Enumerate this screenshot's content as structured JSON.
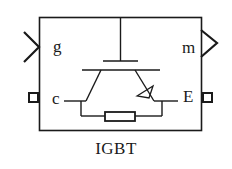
{
  "block": {
    "title": "IGBT",
    "ports": {
      "gate": {
        "label": "g",
        "type": "input-signal",
        "side": "left"
      },
      "measurement": {
        "label": "m",
        "type": "output-signal",
        "side": "right"
      },
      "collector": {
        "label": "c",
        "type": "physical-connection",
        "side": "left"
      },
      "emitter": {
        "label": "E",
        "type": "physical-connection",
        "side": "right"
      }
    },
    "icon": "igbt-transistor-with-snubber-resistor-symbol"
  },
  "colors": {
    "stroke": "#1a1a1a",
    "background": "#ffffff"
  }
}
